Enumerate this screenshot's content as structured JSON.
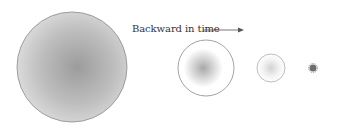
{
  "diagram": {
    "caption": "Backward in time",
    "arrow_direction": "right",
    "colors": {
      "outline": "#8a8a8a",
      "fill_center": "#9a9a9a",
      "fill_edge": "#dcdcdc",
      "text": "#333333",
      "arrow": "#555555"
    },
    "circles": [
      {
        "label": "largest",
        "cx": 72,
        "cy": 67,
        "r": 55
      },
      {
        "label": "medium",
        "cx": 206,
        "cy": 68,
        "r": 28
      },
      {
        "label": "small",
        "cx": 271,
        "cy": 68,
        "r": 14
      },
      {
        "label": "point",
        "cx": 313,
        "cy": 68,
        "r": 4
      }
    ]
  }
}
